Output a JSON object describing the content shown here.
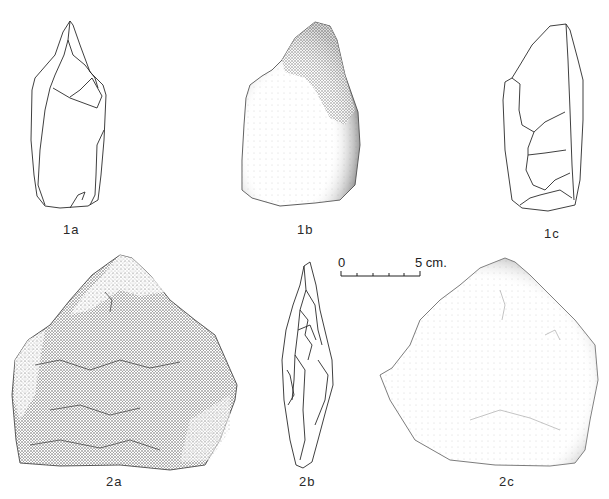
{
  "plate": {
    "figures": [
      {
        "id": "1a",
        "label": "1a",
        "style": "line-drawing"
      },
      {
        "id": "1b",
        "label": "1b",
        "style": "stippled"
      },
      {
        "id": "1c",
        "label": "1c",
        "style": "line-drawing"
      },
      {
        "id": "2a",
        "label": "2a",
        "style": "stippled"
      },
      {
        "id": "2b",
        "label": "2b",
        "style": "line-drawing"
      },
      {
        "id": "2c",
        "label": "2c",
        "style": "stippled"
      }
    ],
    "scale_bar": {
      "start_label": "0",
      "end_label": "5 cm.",
      "ticks": 5
    }
  },
  "colors": {
    "ink": "#2a2a2a",
    "paper": "#ffffff",
    "stipple_dark": "#555555",
    "stipple_light": "#d8d8d8"
  }
}
